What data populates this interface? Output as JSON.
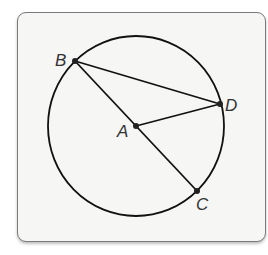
{
  "diagram": {
    "type": "circle-geometry",
    "circle": {
      "center": "A",
      "cx": 136,
      "cy": 126,
      "rx": 88,
      "ry": 90
    },
    "points": [
      {
        "name": "A",
        "x": 136,
        "y": 126,
        "label": "A",
        "lx": 117,
        "ly": 137
      },
      {
        "name": "B",
        "x": 75,
        "y": 61,
        "label": "B",
        "lx": 55,
        "ly": 66
      },
      {
        "name": "C",
        "x": 197,
        "y": 191,
        "label": "C",
        "lx": 196,
        "ly": 210
      },
      {
        "name": "D",
        "x": 220,
        "y": 104,
        "label": "D",
        "lx": 225,
        "ly": 111
      }
    ],
    "segments": [
      {
        "from": "B",
        "to": "D"
      },
      {
        "from": "B",
        "to": "C"
      },
      {
        "from": "A",
        "to": "D"
      }
    ],
    "colors": {
      "stroke": "#111111",
      "frame": "#7a7a7a",
      "background": "#f6f6f5",
      "label": "#333333"
    }
  }
}
